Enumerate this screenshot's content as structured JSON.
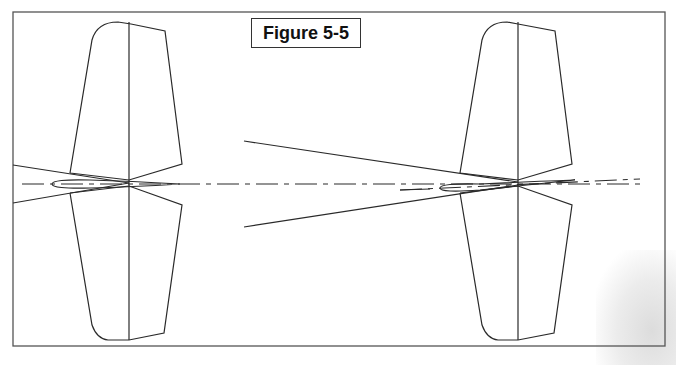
{
  "figure": {
    "title": "Figure 5-5",
    "caption_fragment": "The ... of ..."
  },
  "colors": {
    "line": "#2a2a2a",
    "frame": "#555555",
    "background": "#ffffff"
  },
  "diagram": {
    "left_tail": {
      "description": "Vertical stabilizer planform with centerline, airfoil section at root, converging lines to hinge point",
      "hinge_point": [
        129,
        183
      ]
    },
    "right_tail": {
      "description": "Vertical stabilizer planform, airfoil deflected, with large converging wedge from left",
      "hinge_point": [
        518,
        183
      ]
    },
    "centerline": "dash-dot reference line across figure"
  }
}
